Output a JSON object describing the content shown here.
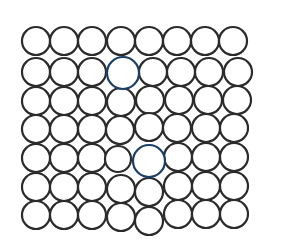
{
  "diagram": {
    "type": "atomic-lattice",
    "colors": {
      "atom_fill": "#ffffff",
      "atom_stroke": "#2b2b2b",
      "highlight_fill": "#2a7fd0",
      "highlight_stroke": "#1b3f66",
      "background": "#ffffff"
    },
    "rows": [
      {
        "atoms": [
          {
            "cx": 36,
            "cy": 41,
            "r": 14
          },
          {
            "cx": 64,
            "cy": 41,
            "r": 14
          },
          {
            "cx": 92,
            "cy": 41,
            "r": 14
          },
          {
            "cx": 121,
            "cy": 41,
            "r": 14
          },
          {
            "cx": 149,
            "cy": 41,
            "r": 14
          },
          {
            "cx": 177,
            "cy": 41,
            "r": 14
          },
          {
            "cx": 205,
            "cy": 41,
            "r": 14
          },
          {
            "cx": 233,
            "cy": 41,
            "r": 14
          }
        ]
      },
      {
        "atoms": [
          {
            "cx": 36,
            "cy": 72,
            "r": 14
          },
          {
            "cx": 64,
            "cy": 72,
            "r": 14
          },
          {
            "cx": 92,
            "cy": 72,
            "r": 14
          },
          {
            "cx": 123,
            "cy": 73,
            "r": 16,
            "highlight": true
          },
          {
            "cx": 153,
            "cy": 72,
            "r": 14
          },
          {
            "cx": 181,
            "cy": 72,
            "r": 14
          },
          {
            "cx": 209,
            "cy": 72,
            "r": 14
          },
          {
            "cx": 238,
            "cy": 72,
            "r": 14
          }
        ]
      },
      {
        "atoms": [
          {
            "cx": 36,
            "cy": 101,
            "r": 14
          },
          {
            "cx": 64,
            "cy": 101,
            "r": 14
          },
          {
            "cx": 92,
            "cy": 101,
            "r": 14
          },
          {
            "cx": 121,
            "cy": 102,
            "r": 14
          },
          {
            "cx": 150,
            "cy": 100,
            "r": 14
          },
          {
            "cx": 179,
            "cy": 100,
            "r": 14
          },
          {
            "cx": 208,
            "cy": 100,
            "r": 14
          },
          {
            "cx": 237,
            "cy": 100,
            "r": 14
          }
        ]
      },
      {
        "atoms": [
          {
            "cx": 36,
            "cy": 129,
            "r": 14
          },
          {
            "cx": 64,
            "cy": 129,
            "r": 14
          },
          {
            "cx": 92,
            "cy": 129,
            "r": 14
          },
          {
            "cx": 120,
            "cy": 130,
            "r": 14
          },
          {
            "cx": 149,
            "cy": 127,
            "r": 14
          },
          {
            "cx": 177,
            "cy": 128,
            "r": 14
          },
          {
            "cx": 206,
            "cy": 128,
            "r": 14
          },
          {
            "cx": 234,
            "cy": 128,
            "r": 14
          }
        ]
      },
      {
        "atoms": [
          {
            "cx": 36,
            "cy": 158,
            "r": 14
          },
          {
            "cx": 64,
            "cy": 158,
            "r": 14
          },
          {
            "cx": 92,
            "cy": 158,
            "r": 14
          },
          {
            "cx": 118,
            "cy": 159,
            "r": 13
          },
          {
            "cx": 149,
            "cy": 161,
            "r": 16,
            "highlight": true
          },
          {
            "cx": 178,
            "cy": 157,
            "r": 14
          },
          {
            "cx": 206,
            "cy": 157,
            "r": 14
          },
          {
            "cx": 234,
            "cy": 157,
            "r": 14
          }
        ]
      },
      {
        "atoms": [
          {
            "cx": 36,
            "cy": 187,
            "r": 14
          },
          {
            "cx": 64,
            "cy": 187,
            "r": 14
          },
          {
            "cx": 92,
            "cy": 187,
            "r": 14
          },
          {
            "cx": 121,
            "cy": 189,
            "r": 14
          },
          {
            "cx": 149,
            "cy": 192,
            "r": 14
          },
          {
            "cx": 178,
            "cy": 186,
            "r": 14
          },
          {
            "cx": 206,
            "cy": 186,
            "r": 14
          },
          {
            "cx": 234,
            "cy": 186,
            "r": 14
          }
        ]
      },
      {
        "atoms": [
          {
            "cx": 36,
            "cy": 215,
            "r": 14
          },
          {
            "cx": 64,
            "cy": 215,
            "r": 14
          },
          {
            "cx": 92,
            "cy": 215,
            "r": 14
          },
          {
            "cx": 121,
            "cy": 217,
            "r": 14
          },
          {
            "cx": 149,
            "cy": 221,
            "r": 14
          },
          {
            "cx": 178,
            "cy": 214,
            "r": 14
          },
          {
            "cx": 206,
            "cy": 214,
            "r": 14
          },
          {
            "cx": 234,
            "cy": 214,
            "r": 14
          }
        ]
      }
    ]
  }
}
